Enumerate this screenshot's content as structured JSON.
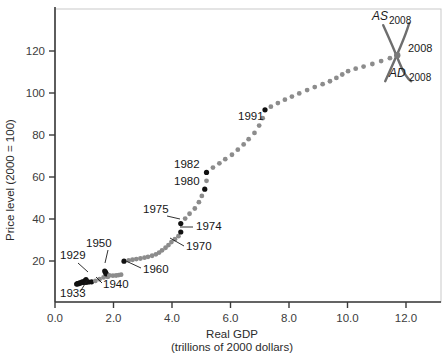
{
  "chart_data": {
    "type": "scatter",
    "title": "",
    "xlabel": "Real GDP",
    "xlabel_sub": "(trillions of 2000 dollars)",
    "ylabel": "Price level (2000 = 100)",
    "xlim": [
      0.0,
      12.9
    ],
    "ylim": [
      0,
      132
    ],
    "grid": false,
    "legend": "none",
    "x_ticks": [
      "0.0",
      "2.0",
      "4.0",
      "6.0",
      "8.0",
      "10.0",
      "12.0"
    ],
    "x_tick_values": [
      0.0,
      2.0,
      4.0,
      6.0,
      8.0,
      10.0,
      12.0
    ],
    "y_ticks": [
      "20",
      "40",
      "60",
      "80",
      "100",
      "120"
    ],
    "y_tick_values": [
      20,
      40,
      60,
      80,
      100,
      120
    ],
    "point_color": "#8c8c8c",
    "highlight_color": "#111111",
    "curve_color": "#6e6e6e",
    "points": [
      {
        "x": 1.06,
        "y": 11.2,
        "label": "1929",
        "highlight": true
      },
      {
        "x": 1.02,
        "y": 10.6,
        "highlight": true
      },
      {
        "x": 0.93,
        "y": 10.1,
        "highlight": true
      },
      {
        "x": 0.84,
        "y": 9.6,
        "highlight": true
      },
      {
        "x": 0.77,
        "y": 9.2,
        "highlight": true
      },
      {
        "x": 0.74,
        "y": 9.0,
        "label": "1933",
        "highlight": true
      },
      {
        "x": 0.8,
        "y": 9.2,
        "highlight": true
      },
      {
        "x": 0.87,
        "y": 9.5,
        "highlight": true
      },
      {
        "x": 0.94,
        "y": 9.8,
        "highlight": true
      },
      {
        "x": 1.02,
        "y": 9.9,
        "highlight": true
      },
      {
        "x": 1.1,
        "y": 10.1,
        "highlight": true
      },
      {
        "x": 1.05,
        "y": 9.9,
        "highlight": true
      },
      {
        "x": 1.15,
        "y": 10.0,
        "highlight": true
      },
      {
        "x": 1.25,
        "y": 10.1,
        "label": "1940",
        "highlight": true
      },
      {
        "x": 1.38,
        "y": 10.5
      },
      {
        "x": 1.52,
        "y": 11.3
      },
      {
        "x": 1.66,
        "y": 12.2
      },
      {
        "x": 1.79,
        "y": 12.5
      },
      {
        "x": 1.82,
        "y": 12.6
      },
      {
        "x": 1.8,
        "y": 13.0
      },
      {
        "x": 1.72,
        "y": 14.2
      },
      {
        "x": 1.7,
        "y": 15.2,
        "label": "1950",
        "highlight": true
      },
      {
        "x": 1.73,
        "y": 14.6,
        "highlight": true
      },
      {
        "x": 1.75,
        "y": 13.9,
        "highlight": true
      },
      {
        "x": 1.86,
        "y": 13.2
      },
      {
        "x": 1.98,
        "y": 13.0
      },
      {
        "x": 2.09,
        "y": 13.1
      },
      {
        "x": 2.18,
        "y": 13.3
      },
      {
        "x": 2.26,
        "y": 13.5
      },
      {
        "x": 2.36,
        "y": 19.9,
        "label": "1960",
        "highlight": true
      },
      {
        "x": 2.52,
        "y": 20.3
      },
      {
        "x": 2.65,
        "y": 20.6
      },
      {
        "x": 2.78,
        "y": 20.9
      },
      {
        "x": 2.92,
        "y": 21.2
      },
      {
        "x": 3.06,
        "y": 21.6
      },
      {
        "x": 3.18,
        "y": 22.0
      },
      {
        "x": 3.32,
        "y": 22.5
      },
      {
        "x": 3.45,
        "y": 23.2
      },
      {
        "x": 3.56,
        "y": 24.0
      },
      {
        "x": 3.66,
        "y": 25.1
      },
      {
        "x": 3.78,
        "y": 26.3
      },
      {
        "x": 3.88,
        "y": 27.6,
        "label": "1970"
      },
      {
        "x": 3.98,
        "y": 29.0
      },
      {
        "x": 4.1,
        "y": 30.4
      },
      {
        "x": 4.22,
        "y": 31.8
      },
      {
        "x": 4.3,
        "y": 33.8,
        "label": "1974",
        "highlight": true
      },
      {
        "x": 4.3,
        "y": 37.8,
        "label": "1975",
        "highlight": true
      },
      {
        "x": 4.45,
        "y": 40.2
      },
      {
        "x": 4.6,
        "y": 42.5
      },
      {
        "x": 4.78,
        "y": 45.0
      },
      {
        "x": 4.92,
        "y": 48.0
      },
      {
        "x": 5.02,
        "y": 51.0
      },
      {
        "x": 5.12,
        "y": 54.2,
        "label": "1980",
        "highlight": true
      },
      {
        "x": 5.18,
        "y": 58.2
      },
      {
        "x": 5.18,
        "y": 62.2,
        "label": "1982",
        "highlight": true
      },
      {
        "x": 5.4,
        "y": 64.5
      },
      {
        "x": 5.62,
        "y": 66.5
      },
      {
        "x": 5.82,
        "y": 68.5
      },
      {
        "x": 6.05,
        "y": 70.6
      },
      {
        "x": 6.25,
        "y": 73.0
      },
      {
        "x": 6.45,
        "y": 75.5
      },
      {
        "x": 6.62,
        "y": 78.0
      },
      {
        "x": 6.82,
        "y": 81.0
      },
      {
        "x": 6.98,
        "y": 84.5
      },
      {
        "x": 7.1,
        "y": 88.0
      },
      {
        "x": 7.18,
        "y": 92.0,
        "label": "1991",
        "highlight": true
      },
      {
        "x": 7.38,
        "y": 93.5
      },
      {
        "x": 7.62,
        "y": 95.2
      },
      {
        "x": 7.86,
        "y": 96.8
      },
      {
        "x": 8.1,
        "y": 98.3
      },
      {
        "x": 8.35,
        "y": 99.8
      },
      {
        "x": 8.62,
        "y": 101.4
      },
      {
        "x": 8.88,
        "y": 102.8
      },
      {
        "x": 9.15,
        "y": 104.2
      },
      {
        "x": 9.4,
        "y": 105.6
      },
      {
        "x": 9.62,
        "y": 107.2
      },
      {
        "x": 9.82,
        "y": 108.8
      },
      {
        "x": 10.02,
        "y": 110.4
      },
      {
        "x": 10.28,
        "y": 111.6
      },
      {
        "x": 10.55,
        "y": 112.6
      },
      {
        "x": 10.85,
        "y": 113.8
      },
      {
        "x": 11.15,
        "y": 115.2
      },
      {
        "x": 11.45,
        "y": 116.6
      },
      {
        "x": 11.7,
        "y": 118.0,
        "label": "2008",
        "highlight": false
      }
    ],
    "annotations": [
      {
        "name": "label-1929",
        "text": "1929",
        "tx": 60,
        "ty": 259,
        "lx": 78,
        "ly": 263,
        "px": 88,
        "py": 272,
        "anchor": "start"
      },
      {
        "name": "label-1933",
        "text": "1933",
        "tx": 60,
        "ty": 297,
        "lx": 80,
        "ly": 292,
        "px": 88,
        "py": 279,
        "anchor": "start"
      },
      {
        "name": "label-1940",
        "text": "1940",
        "tx": 103,
        "ty": 288,
        "lx": 102,
        "ly": 283,
        "px": 96,
        "py": 277,
        "anchor": "start"
      },
      {
        "name": "label-1950",
        "text": "1950",
        "tx": 86,
        "ty": 247,
        "lx": 108,
        "ly": 250,
        "px": 105,
        "py": 263,
        "anchor": "start"
      },
      {
        "name": "label-1960",
        "text": "1960",
        "tx": 143,
        "ty": 273,
        "lx": 141,
        "ly": 268,
        "px": 126,
        "py": 261,
        "anchor": "start"
      },
      {
        "name": "label-1970",
        "text": "1970",
        "tx": 186,
        "ty": 250,
        "lx": 184,
        "ly": 246,
        "px": 170,
        "py": 238,
        "anchor": "start"
      },
      {
        "name": "label-1974",
        "text": "1974",
        "tx": 196,
        "ty": 230,
        "lx": 193,
        "ly": 227,
        "px": 180,
        "py": 227,
        "anchor": "start"
      },
      {
        "name": "label-1975",
        "text": "1975",
        "tx": 143,
        "ty": 213,
        "lx": 167,
        "ly": 216,
        "px": 180,
        "py": 219,
        "anchor": "start"
      },
      {
        "name": "label-1980",
        "text": "1980",
        "tx": 174,
        "ty": 185,
        "lx": 0,
        "ly": 0,
        "px": 0,
        "py": 0,
        "anchor": "start"
      },
      {
        "name": "label-1982",
        "text": "1982",
        "tx": 174,
        "ty": 168,
        "lx": 0,
        "ly": 0,
        "px": 0,
        "py": 0,
        "anchor": "start"
      },
      {
        "name": "label-1991",
        "text": "1991",
        "tx": 238,
        "ty": 120,
        "lx": 0,
        "ly": 0,
        "px": 0,
        "py": 0,
        "anchor": "start"
      }
    ],
    "model_curves": {
      "as_label": "AS",
      "as_sub": "2008",
      "ad_label": "AD",
      "ad_sub": "2008",
      "point_label": "2008",
      "cross_x": 11.7,
      "cross_y": 118.0
    }
  }
}
